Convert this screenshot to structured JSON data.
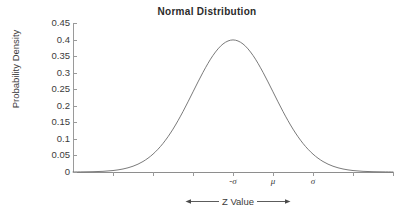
{
  "chart_data": {
    "type": "line",
    "title": "Normal  Distribution",
    "xlabel": "Z Value",
    "ylabel": "Probability Density",
    "grid": false,
    "legend": "none",
    "ylim": [
      0,
      0.45
    ],
    "xlim": [
      -4,
      4
    ],
    "yticks": [
      "0.45",
      "0.4",
      "0.35",
      "0.3",
      "0.25",
      "0.2",
      "0.15",
      "0.1",
      "0.05",
      "0"
    ],
    "ytick_values": [
      0.45,
      0.4,
      0.35,
      0.3,
      0.25,
      0.2,
      0.15,
      0.1,
      0.05,
      0
    ],
    "xticks": [
      "",
      "",
      "",
      "-σ",
      "μ",
      "σ",
      "",
      "",
      ""
    ],
    "xtick_labeled": [
      {
        "label": "-σ",
        "value": -1
      },
      {
        "label": "μ",
        "value": 0
      },
      {
        "label": "σ",
        "value": 1
      }
    ],
    "annotations": [
      {
        "text": "Z Value",
        "style": "double-headed-arrow",
        "position": "below-x-axis"
      }
    ],
    "series": [
      {
        "name": "Standard normal probability density",
        "formula": "f(z) = (1/sqrt(2*pi)) * exp(-z^2/2)",
        "peak": {
          "x": 0,
          "y": 0.399
        },
        "x": [
          -4.0,
          -3.75,
          -3.5,
          -3.25,
          -3.0,
          -2.75,
          -2.5,
          -2.25,
          -2.0,
          -1.75,
          -1.5,
          -1.25,
          -1.0,
          -0.75,
          -0.5,
          -0.25,
          0.0,
          0.25,
          0.5,
          0.75,
          1.0,
          1.25,
          1.5,
          1.75,
          2.0,
          2.25,
          2.5,
          2.75,
          3.0,
          3.25,
          3.5,
          3.75,
          4.0
        ],
        "values": [
          0.0001,
          0.0004,
          0.0009,
          0.002,
          0.0044,
          0.0091,
          0.0175,
          0.0317,
          0.054,
          0.0863,
          0.1295,
          0.1826,
          0.242,
          0.3011,
          0.3521,
          0.3867,
          0.3989,
          0.3867,
          0.3521,
          0.3011,
          0.242,
          0.1826,
          0.1295,
          0.0863,
          0.054,
          0.0317,
          0.0175,
          0.0091,
          0.0044,
          0.002,
          0.0009,
          0.0004,
          0.0001
        ]
      }
    ],
    "colors": {
      "curve": "#6b6b6b",
      "axis": "#9a9a9a",
      "text": "#3b3b3b",
      "title": "#2b2b2b",
      "background": "#ffffff"
    }
  }
}
